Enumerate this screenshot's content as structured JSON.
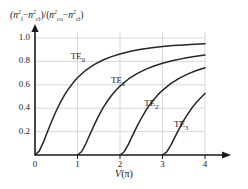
{
  "chart_data": {
    "type": "line",
    "title": "",
    "ylabel": "(n_f^2 - n_cl^2)/(n_co^2 - n_cl^2)",
    "ylabel_parts": {
      "open1": "(",
      "n1": "n",
      "n1_sup": "2",
      "n1_sub": "f",
      "minus1": "−",
      "n2": "n",
      "n2_sup": "2",
      "n2_sub": "cl",
      "close1": ")/(",
      "n3": "n",
      "n3_sup": "2",
      "n3_sub": "co",
      "minus2": "−",
      "n4": "n",
      "n4_sup": "2",
      "n4_sub": "cl",
      "close2": ")"
    },
    "xlabel": "V(π)",
    "xlabel_var": "V",
    "xlabel_arg": "(π)",
    "xlim": [
      0,
      4.3
    ],
    "ylim": [
      0,
      1.06
    ],
    "xticks": [
      "0",
      "1",
      "2",
      "3",
      "4"
    ],
    "xtick_values": [
      0,
      1,
      2,
      3,
      4
    ],
    "yticks": [
      "0.2",
      "0.4",
      "0.6",
      "0.8",
      "1.0"
    ],
    "ytick_values": [
      0.2,
      0.4,
      0.6,
      0.8,
      1.0
    ],
    "grid": true,
    "grid_color": "#c8c8c8",
    "axis_color": "#1a1a1a",
    "curve_color": "#262626",
    "legend_position": "inline-annotations",
    "series": [
      {
        "name": "TE0",
        "label": "TE",
        "label_sub": "0",
        "cutoff": 0,
        "label_x": 1.05,
        "label_y": 0.84,
        "x": [
          0,
          0.1,
          0.2,
          0.3,
          0.4,
          0.5,
          0.6,
          0.7,
          0.8,
          0.9,
          1.0,
          1.2,
          1.4,
          1.6,
          1.8,
          2.0,
          2.25,
          2.5,
          2.75,
          3.0,
          3.25,
          3.5,
          3.75,
          4.0
        ],
        "y": [
          0,
          0.033,
          0.112,
          0.205,
          0.295,
          0.378,
          0.452,
          0.516,
          0.571,
          0.619,
          0.66,
          0.726,
          0.775,
          0.812,
          0.841,
          0.864,
          0.886,
          0.903,
          0.916,
          0.927,
          0.935,
          0.941,
          0.946,
          0.95
        ]
      },
      {
        "name": "TE1",
        "label": "TE",
        "label_sub": "1",
        "cutoff": 1,
        "label_x": 2.0,
        "label_y": 0.63,
        "x": [
          1.0,
          1.1,
          1.2,
          1.3,
          1.4,
          1.5,
          1.6,
          1.7,
          1.8,
          1.9,
          2.0,
          2.2,
          2.4,
          2.6,
          2.8,
          3.0,
          3.25,
          3.5,
          3.75,
          4.0
        ],
        "y": [
          0,
          0.03,
          0.1,
          0.182,
          0.262,
          0.336,
          0.402,
          0.459,
          0.509,
          0.552,
          0.589,
          0.65,
          0.696,
          0.732,
          0.761,
          0.784,
          0.807,
          0.826,
          0.841,
          0.854
        ]
      },
      {
        "name": "TE2",
        "label": "TE",
        "label_sub": "2",
        "cutoff": 2,
        "label_x": 2.78,
        "label_y": 0.44,
        "x": [
          2.0,
          2.1,
          2.2,
          2.3,
          2.4,
          2.5,
          2.6,
          2.7,
          2.8,
          2.9,
          3.0,
          3.2,
          3.4,
          3.6,
          3.8,
          4.0
        ],
        "y": [
          0,
          0.028,
          0.093,
          0.17,
          0.245,
          0.314,
          0.376,
          0.43,
          0.477,
          0.518,
          0.553,
          0.612,
          0.657,
          0.693,
          0.722,
          0.745
        ]
      },
      {
        "name": "TE3",
        "label": "TE",
        "label_sub": "3",
        "cutoff": 3,
        "label_x": 3.48,
        "label_y": 0.255,
        "x": [
          3.0,
          3.1,
          3.2,
          3.3,
          3.4,
          3.5,
          3.6,
          3.7,
          3.8,
          3.9,
          4.0
        ],
        "y": [
          0,
          0.026,
          0.087,
          0.159,
          0.23,
          0.296,
          0.354,
          0.406,
          0.451,
          0.49,
          0.525
        ]
      }
    ]
  }
}
